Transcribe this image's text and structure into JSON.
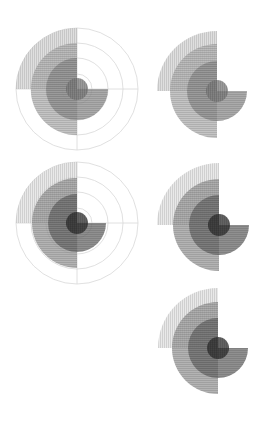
{
  "chart_data": [
    {
      "type": "polar-area",
      "title": "",
      "grid": true,
      "center": [
        77,
        89
      ],
      "grid_radii": [
        15,
        31,
        46,
        61
      ],
      "layers": [
        {
          "name": "layer-1",
          "start_deg": 90,
          "end_deg": 180,
          "radius": 61,
          "shade": "#d4d4d4",
          "hatch": "vertical"
        },
        {
          "name": "layer-2",
          "start_deg": 90,
          "end_deg": 270,
          "radius": 46,
          "shade": "#b0b0b0",
          "hatch": "horizontal"
        },
        {
          "name": "layer-3",
          "start_deg": 90,
          "end_deg": 360,
          "radius": 31,
          "shade": "#8e8e8e",
          "hatch": "horizontal"
        },
        {
          "name": "layer-4",
          "start_deg": 0,
          "end_deg": 360,
          "radius": 11,
          "shade": "#7a7a7a",
          "hatch": "vertical"
        }
      ]
    },
    {
      "type": "polar-area",
      "title": "",
      "grid": false,
      "center": [
        217,
        91
      ],
      "layers": [
        {
          "name": "layer-1",
          "start_deg": 90,
          "end_deg": 180,
          "radius": 60,
          "shade": "#d4d4d4",
          "hatch": "vertical"
        },
        {
          "name": "layer-2",
          "start_deg": 90,
          "end_deg": 270,
          "radius": 47,
          "shade": "#b0b0b0",
          "hatch": "horizontal"
        },
        {
          "name": "layer-3",
          "start_deg": 90,
          "end_deg": 360,
          "radius": 30,
          "shade": "#8e8e8e",
          "hatch": "horizontal"
        },
        {
          "name": "layer-4",
          "start_deg": 0,
          "end_deg": 360,
          "radius": 11,
          "shade": "#7a7a7a",
          "hatch": "vertical"
        }
      ]
    },
    {
      "type": "polar-area",
      "title": "",
      "grid": true,
      "center": [
        77,
        223
      ],
      "grid_radii": [
        15,
        31,
        46,
        61
      ],
      "layers": [
        {
          "name": "layer-1",
          "start_deg": 90,
          "end_deg": 180,
          "radius": 61,
          "shade": "#e2e2e2",
          "hatch": "vertical"
        },
        {
          "name": "layer-2",
          "start_deg": 90,
          "end_deg": 270,
          "radius": 45,
          "shade": "#9a9a9a",
          "hatch": "horizontal"
        },
        {
          "name": "layer-3",
          "start_deg": 90,
          "end_deg": 360,
          "radius": 29,
          "shade": "#6a6a6a",
          "hatch": "horizontal"
        },
        {
          "name": "layer-4",
          "start_deg": 0,
          "end_deg": 360,
          "radius": 11,
          "shade": "#2e2e2e",
          "hatch": "vertical"
        }
      ]
    },
    {
      "type": "polar-area",
      "title": "",
      "grid": false,
      "center": [
        219,
        225
      ],
      "layers": [
        {
          "name": "layer-1",
          "start_deg": 90,
          "end_deg": 180,
          "radius": 62,
          "shade": "#e2e2e2",
          "hatch": "vertical"
        },
        {
          "name": "layer-2",
          "start_deg": 90,
          "end_deg": 270,
          "radius": 46,
          "shade": "#9a9a9a",
          "hatch": "horizontal"
        },
        {
          "name": "layer-3",
          "start_deg": 90,
          "end_deg": 360,
          "radius": 30,
          "shade": "#6a6a6a",
          "hatch": "horizontal"
        },
        {
          "name": "layer-4",
          "start_deg": 0,
          "end_deg": 360,
          "radius": 11,
          "shade": "#2e2e2e",
          "hatch": "vertical"
        }
      ]
    },
    {
      "type": "polar-area",
      "title": "",
      "grid": false,
      "center": [
        218,
        348
      ],
      "layers": [
        {
          "name": "layer-1",
          "start_deg": 90,
          "end_deg": 180,
          "radius": 60,
          "shade": "#e2e2e2",
          "hatch": "vertical"
        },
        {
          "name": "layer-2",
          "start_deg": 90,
          "end_deg": 270,
          "radius": 46,
          "shade": "#9a9a9a",
          "hatch": "horizontal"
        },
        {
          "name": "layer-3",
          "start_deg": 90,
          "end_deg": 360,
          "radius": 30,
          "shade": "#6a6a6a",
          "hatch": "horizontal"
        },
        {
          "name": "layer-4",
          "start_deg": 0,
          "end_deg": 360,
          "radius": 11,
          "shade": "#2e2e2e",
          "hatch": "vertical"
        }
      ]
    }
  ],
  "colors": {
    "grid": "#d8d8d8",
    "background": "#ffffff"
  }
}
